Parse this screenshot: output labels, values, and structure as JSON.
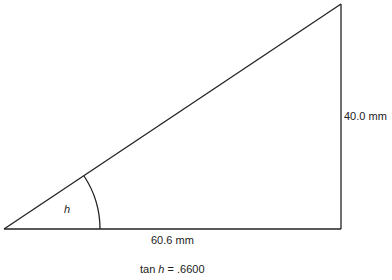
{
  "diagram": {
    "type": "right-triangle",
    "angle_label": "h",
    "base_label": "60.6 mm",
    "height_label": "40.0 mm",
    "caption": {
      "prefix": "tan ",
      "variable": "h",
      "suffix": " = .6600"
    },
    "stroke_color": "#222222"
  }
}
